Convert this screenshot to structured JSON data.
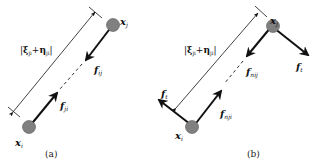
{
  "colors": {
    "line": "#111111",
    "particle_fill": "#808080",
    "particle_stroke": "#555555",
    "background": "#ffffff"
  },
  "panels": [
    {
      "caption": "(a)",
      "particles": [
        {
          "id": "xi",
          "symbol": "x",
          "subscript": "i"
        },
        {
          "id": "xj",
          "symbol": "x",
          "subscript": "j"
        }
      ],
      "distance_label": {
        "open": "|",
        "xi": "ξ",
        "xi_sub": "ji",
        "plus": "+",
        "eta": "η",
        "eta_sub": "ji",
        "close": "|"
      },
      "forces": [
        {
          "symbol": "f",
          "subscript": "ij"
        },
        {
          "symbol": "f",
          "subscript": "ji"
        }
      ]
    },
    {
      "caption": "(b)",
      "particles": [
        {
          "id": "xi",
          "symbol": "x",
          "subscript": "i"
        },
        {
          "id": "xj",
          "symbol": "x",
          "subscript": "j"
        }
      ],
      "distance_label": {
        "open": "|",
        "xi": "ξ",
        "xi_sub": "ji",
        "plus": "+",
        "eta": "η",
        "eta_sub": "ji",
        "close": "|"
      },
      "forces": [
        {
          "symbol": "f",
          "subscript": "nij"
        },
        {
          "symbol": "f",
          "subscript": "nji"
        },
        {
          "symbol": "f",
          "subscript": "t"
        },
        {
          "symbol": "f",
          "subscript": "t"
        }
      ]
    }
  ]
}
